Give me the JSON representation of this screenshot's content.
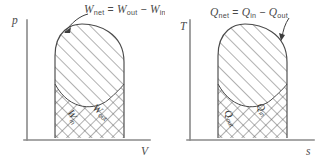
{
  "figure": {
    "background_color": "#ffffff",
    "line_color": "#4a4a4a",
    "axis_color": "#8a8a8a"
  },
  "panels": [
    {
      "id": "work-diagram",
      "y_axis_label": "p",
      "x_axis_label": "V",
      "caption": {
        "lhs": "W",
        "lhs_sub": "net",
        "eq": "=",
        "term1": "W",
        "term1_sub": "out",
        "op": "−",
        "term2": "W",
        "term2_sub": "in"
      },
      "regions": [
        {
          "name": "upper-hatched-region",
          "label": "W",
          "label_sub": "out",
          "hatch": "single"
        },
        {
          "name": "lower-crosshatched-region",
          "label": "W",
          "label_sub": "in",
          "hatch": "cross"
        }
      ]
    },
    {
      "id": "heat-diagram",
      "y_axis_label": "T",
      "x_axis_label": "s",
      "caption": {
        "lhs": "Q",
        "lhs_sub": "net",
        "eq": "=",
        "term1": "Q",
        "term1_sub": "in",
        "op": "−",
        "term2": "Q",
        "term2_sub": "out"
      },
      "regions": [
        {
          "name": "upper-hatched-region",
          "label": "Q",
          "label_sub": "in",
          "hatch": "single"
        },
        {
          "name": "lower-crosshatched-region",
          "label": "Q",
          "label_sub": "out",
          "hatch": "cross"
        }
      ]
    }
  ]
}
